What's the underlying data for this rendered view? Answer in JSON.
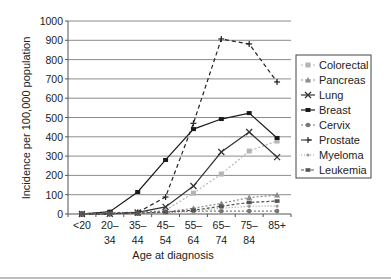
{
  "chart_data": {
    "type": "line",
    "title": "",
    "xlabel": "Age at diagnosis",
    "ylabel": "Incidence per 100,000 population",
    "ylim": [
      0,
      1000
    ],
    "yticks": [
      0,
      100,
      200,
      300,
      400,
      500,
      600,
      700,
      800,
      900,
      1000
    ],
    "grid": true,
    "legend_position": "right",
    "categories": [
      [
        "<20",
        ""
      ],
      [
        "20–",
        "34"
      ],
      [
        "35–",
        "44"
      ],
      [
        "45–",
        "54"
      ],
      [
        "55–",
        "64"
      ],
      [
        "65–",
        "74"
      ],
      [
        "75–",
        "84"
      ],
      [
        "85+",
        ""
      ]
    ],
    "series": [
      {
        "name": "Colorectal",
        "color": "#b5b5b5",
        "dash": "2,2",
        "marker": "square",
        "values": [
          0,
          2,
          6,
          20,
          108,
          207,
          326,
          378
        ]
      },
      {
        "name": "Pancreas",
        "color": "#8a8a8a",
        "dash": "2,2",
        "marker": "triangle",
        "values": [
          0,
          1,
          3,
          10,
          30,
          55,
          85,
          98
        ]
      },
      {
        "name": "Lung",
        "color": "#333333",
        "dash": "",
        "marker": "x",
        "values": [
          0,
          1,
          8,
          37,
          145,
          321,
          425,
          295
        ]
      },
      {
        "name": "Breast",
        "color": "#1a1a1a",
        "dash": "",
        "marker": "bar-x",
        "values": [
          0,
          12,
          114,
          280,
          440,
          492,
          523,
          394
        ]
      },
      {
        "name": "Cervix",
        "color": "#777777",
        "dash": "2,2",
        "marker": "circle",
        "values": [
          0,
          5,
          10,
          12,
          14,
          15,
          15,
          15
        ]
      },
      {
        "name": "Prostate",
        "color": "#222222",
        "dash": "4,3",
        "marker": "plus",
        "values": [
          0,
          1,
          8,
          88,
          470,
          907,
          881,
          684
        ]
      },
      {
        "name": "Myeloma",
        "color": "#999999",
        "dash": "1,2",
        "marker": "dot",
        "values": [
          0,
          0,
          2,
          6,
          15,
          30,
          40,
          41
        ]
      },
      {
        "name": "Leukemia",
        "color": "#555555",
        "dash": "3,2",
        "marker": "rect",
        "values": [
          3,
          4,
          5,
          10,
          20,
          40,
          60,
          67
        ]
      }
    ]
  }
}
